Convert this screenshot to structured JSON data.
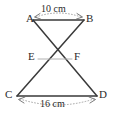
{
  "figure": {
    "type": "geometry-diagram",
    "background_color": "#ffffff",
    "stroke_color": "#3a3a3a",
    "light_stroke_color": "#b0b0b0",
    "text_color": "#2b2b2b",
    "points": [
      {
        "name": "A",
        "label": "A",
        "x": 33,
        "y": 20,
        "label_x": 27,
        "label_y": 14
      },
      {
        "name": "B",
        "label": "B",
        "x": 84,
        "y": 20,
        "label_x": 87,
        "label_y": 14
      },
      {
        "name": "E",
        "label": "E",
        "x": 38,
        "y": 59,
        "label_x": 29,
        "label_y": 52
      },
      {
        "name": "F",
        "label": "F",
        "x": 72,
        "y": 59,
        "label_x": 74,
        "label_y": 52
      },
      {
        "name": "C",
        "label": "C",
        "x": 17,
        "y": 96,
        "label_x": 6,
        "label_y": 89
      },
      {
        "name": "D",
        "label": "D",
        "x": 97,
        "y": 96,
        "label_x": 99,
        "label_y": 89
      },
      {
        "name": "X",
        "label": "",
        "x": 58,
        "y": 45,
        "label_x": 0,
        "label_y": 0
      }
    ],
    "segments": [
      {
        "name": "segment-AB",
        "from": "A",
        "to": "B",
        "weight": "normal"
      },
      {
        "name": "segment-A-to-D",
        "from": "A",
        "to": "D",
        "weight": "normal"
      },
      {
        "name": "segment-B-to-C",
        "from": "B",
        "to": "C",
        "weight": "normal"
      },
      {
        "name": "segment-EF",
        "from": "E",
        "to": "F",
        "weight": "light"
      },
      {
        "name": "segment-CD",
        "from": "C",
        "to": "D",
        "weight": "normal"
      }
    ],
    "dimensions": [
      {
        "name": "dimension-ab",
        "label": "10 cm",
        "measures": "AB",
        "position": "above",
        "label_x": 44,
        "label_y": 6
      },
      {
        "name": "dimension-cd",
        "label": "16 cm",
        "measures": "CD",
        "position": "below",
        "label_x": 41,
        "label_y": 100
      }
    ]
  }
}
